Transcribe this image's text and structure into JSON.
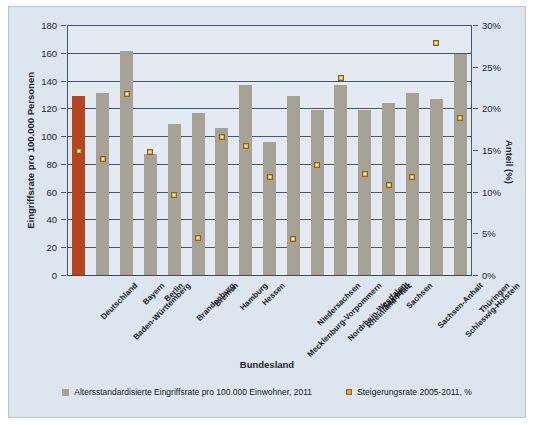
{
  "chart_data": {
    "type": "bar",
    "title": "",
    "xlabel": "Bundesland",
    "ylabel": "Eingriffsrate pro 100.000 Personen",
    "y2label": "Anteil (%)",
    "ylim": [
      0,
      180
    ],
    "yticks": [
      "0",
      "20",
      "40",
      "60",
      "80",
      "100",
      "120",
      "140",
      "160",
      "180"
    ],
    "y2lim": [
      0,
      30
    ],
    "y2ticks": [
      "0%",
      "5%",
      "10%",
      "15%",
      "20%",
      "25%",
      "30%"
    ],
    "grid": true,
    "legend_position": "bottom",
    "categories": [
      "Deutschland",
      "Baden-Württemberg",
      "Bayern",
      "Berlin",
      "Brandenburg",
      "Bremen",
      "Hamburg",
      "Hessen",
      "Mecklenburg-Vorpommern",
      "Niedersachsen",
      "Nordrhein-Westfalen",
      "Rheinland-Pfalz",
      "Saarland",
      "Sachsen",
      "Sachsen-Anhalt",
      "Schleswig-Holstein",
      "Thüringen"
    ],
    "series": [
      {
        "name": "Altersstandardisierte Eingriffsrate pro 100.000 Einwohner, 2011",
        "type": "bar",
        "axis": "left",
        "color": "#a6a396",
        "highlight_index": 0,
        "highlight_color": "#b5441f",
        "values": [
          129,
          131,
          161,
          87,
          109,
          117,
          106,
          137,
          96,
          129,
          119,
          137,
          119,
          124,
          131,
          127,
          159
        ]
      },
      {
        "name": "Steigerungsrate 2005-2011, %",
        "type": "scatter",
        "axis": "right",
        "color": "#e0a83c",
        "values": [
          14.9,
          13.9,
          21.7,
          14.8,
          9.6,
          4.4,
          16.6,
          15.5,
          11.8,
          4.3,
          13.2,
          23.7,
          12.1,
          10.8,
          11.8,
          27.9,
          18.8
        ]
      }
    ]
  }
}
